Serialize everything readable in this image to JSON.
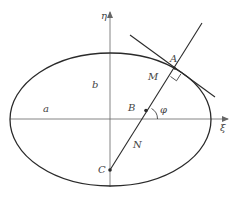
{
  "diagram": {
    "type": "ellipse-normal-geometry",
    "colors": {
      "stroke": "#2a2a2a",
      "axis": "#666666",
      "label": "#444444",
      "background": "#ffffff"
    },
    "axes": {
      "horizontal_label": "ξ",
      "vertical_label": "η"
    },
    "labels": {
      "a": "a",
      "b": "b",
      "A": "A",
      "M": "M",
      "B": "B",
      "phi": "φ",
      "N": "N",
      "C": "C"
    },
    "elements": [
      {
        "kind": "ellipse",
        "center": [
          110,
          119
        ],
        "rx": 100.5,
        "ry": 66.5
      },
      {
        "kind": "axis",
        "name": "xi-axis",
        "from": [
          10,
          119
        ],
        "to": [
          228,
          119
        ]
      },
      {
        "kind": "axis",
        "name": "eta-axis",
        "from": [
          110,
          186
        ],
        "to": [
          110,
          12
        ]
      },
      {
        "kind": "line",
        "name": "normal-line",
        "from": [
          110,
          170
        ],
        "to": [
          202,
          23
        ]
      },
      {
        "kind": "line",
        "name": "tangent-line",
        "from": [
          130,
          35
        ],
        "to": [
          215,
          97
        ]
      },
      {
        "kind": "point",
        "name": "A",
        "at": [
          175,
          68
        ]
      },
      {
        "kind": "point",
        "name": "B",
        "at": [
          146,
          110
        ]
      },
      {
        "kind": "point",
        "name": "C",
        "at": [
          110,
          170
        ]
      },
      {
        "kind": "right-angle",
        "at": "A"
      },
      {
        "kind": "angle-arc",
        "name": "phi",
        "at": "B"
      }
    ]
  }
}
